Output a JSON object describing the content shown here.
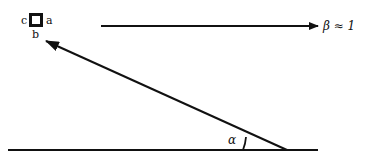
{
  "diagram": {
    "object": {
      "shape": "square",
      "edge_labels": {
        "left": "c",
        "right": "a",
        "bottom": "b"
      }
    },
    "velocity_arrow": {
      "label": "β ≈ 1",
      "direction": "right"
    },
    "incident_ray": {
      "direction": "up-left",
      "target_edge": "b"
    },
    "ground_line": {},
    "angle": {
      "label": "α"
    },
    "colors": {
      "ink": "#111111",
      "background": "#ffffff"
    }
  }
}
